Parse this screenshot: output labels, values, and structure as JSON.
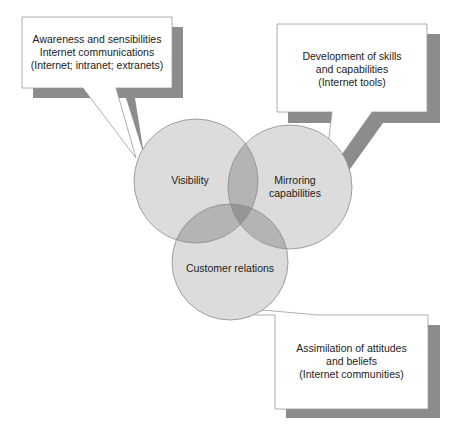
{
  "diagram": {
    "circles": [
      {
        "id": "visibility",
        "label": "Visibility",
        "cx": 196,
        "cy": 181,
        "r": 62
      },
      {
        "id": "mirroring",
        "label_lines": [
          "Mirroring",
          "capabilities"
        ],
        "cx": 290,
        "cy": 187,
        "r": 62
      },
      {
        "id": "customer",
        "label": "Customer relations",
        "cx": 230,
        "cy": 262,
        "r": 58
      }
    ],
    "callouts": [
      {
        "id": "awareness",
        "lines": [
          "Awareness and sensibilities",
          "Internet communications",
          "(Internet; intranet; extranets)"
        ]
      },
      {
        "id": "development",
        "lines": [
          "Development of skills",
          "and capabilities",
          "(Internet tools)"
        ]
      },
      {
        "id": "assimilation",
        "lines": [
          "Assimilation of attitudes",
          "and beliefs",
          "(Internet communities)"
        ]
      }
    ],
    "colors": {
      "circle_fill": "#dcdcdc",
      "circle_stroke": "#8a8a8a",
      "overlap2": "#b4b4b4",
      "overlap3": "#969696",
      "shadow": "#8c8c8c",
      "box_stroke": "#9a9a9a"
    }
  }
}
